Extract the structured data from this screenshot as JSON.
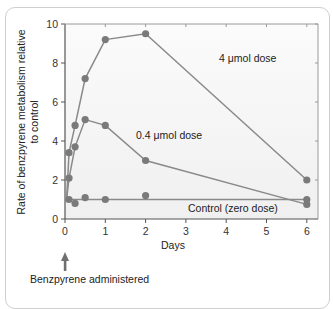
{
  "chart_data": {
    "type": "line",
    "title": "",
    "xlabel": "Days",
    "ylabel": "Rate of benzpyrene metabolism relative to control",
    "ylabel_lines": [
      "Rate of benzpyrene metabolism relative",
      "to control"
    ],
    "xlim": [
      0,
      6.2
    ],
    "ylim": [
      0,
      10
    ],
    "xticks": [
      0,
      1,
      2,
      3,
      4,
      5,
      6
    ],
    "yticks": [
      0,
      2,
      4,
      6,
      8,
      10
    ],
    "grid": false,
    "series": [
      {
        "name": "4 µmol dose",
        "label": "4 μmol dose",
        "x": [
          0.04,
          0.1,
          0.25,
          0.5,
          1,
          2,
          6
        ],
        "y": [
          1.0,
          3.4,
          4.8,
          7.2,
          9.2,
          9.5,
          2.0
        ],
        "markers_from_index": 1
      },
      {
        "name": "0.4 µmol dose",
        "label": "0.4 μmol dose",
        "x": [
          0.04,
          0.1,
          0.25,
          0.5,
          1,
          2,
          6
        ],
        "y": [
          1.0,
          2.1,
          3.7,
          5.1,
          4.8,
          3.0,
          0.75
        ],
        "markers_from_index": 1
      },
      {
        "name": "Control (zero dose)",
        "label": "Control (zero dose)",
        "x": [
          0.1,
          0.25,
          0.5,
          1,
          2,
          6
        ],
        "y": [
          1.0,
          0.8,
          1.1,
          1.0,
          1.2,
          1.0
        ],
        "line_y": 1.0
      }
    ],
    "annotations": [
      {
        "text": "Benzpyrene administered",
        "at_x": 0,
        "type": "arrow-up"
      }
    ]
  },
  "colors": {
    "line": "#8a8a8a",
    "marker": "#7a7a7a",
    "axis": "#555555",
    "plot_bg_top": "#fbfbfb",
    "plot_bg_bottom": "#f0f0f0",
    "arrow": "#6f6f6f"
  }
}
